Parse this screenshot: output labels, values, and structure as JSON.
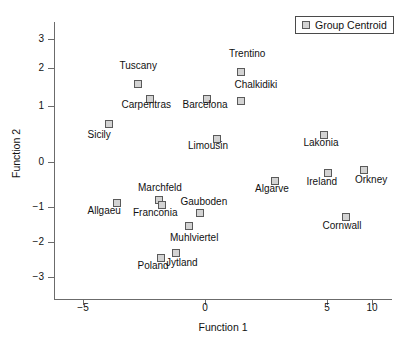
{
  "chart_data": {
    "type": "scatter",
    "title": "",
    "xlabel": "Function 1",
    "ylabel": "Function 2",
    "xlim": [
      -6.5,
      11.5
    ],
    "ylim": [
      -3.6,
      3.6
    ],
    "xticks": [
      -5,
      0,
      5,
      10
    ],
    "xtick_labels": [
      "−5",
      "0",
      "5",
      "10"
    ],
    "yticks": [
      3,
      2,
      1,
      0,
      -1,
      -2,
      -3
    ],
    "ytick_labels": [
      "3",
      "2",
      "1",
      "0",
      "−1",
      "−2",
      "−3"
    ],
    "grid": false,
    "legend_position": "top-right",
    "legend": [
      {
        "label": "Group Centroid",
        "marker": "square",
        "color": "#d3d3d3"
      }
    ],
    "series": [
      {
        "name": "Group Centroid",
        "points": [
          {
            "label": "Tuscany",
            "x": -2.7,
            "y": 1.55,
            "label_pos": "above"
          },
          {
            "label": "Carpentras",
            "x": -2.2,
            "y": 1.18,
            "label_pos": "below"
          },
          {
            "label": "Barcelona",
            "x": 0.1,
            "y": 1.18,
            "label_pos": "below"
          },
          {
            "label": "Trentino",
            "x": 1.5,
            "y": 1.82,
            "label_pos": "above"
          },
          {
            "label": "Chalkidiki",
            "x": 1.5,
            "y": 1.08,
            "label_pos": "above"
          },
          {
            "label": "Sicily",
            "x": -3.9,
            "y": 0.6,
            "label_pos": "below"
          },
          {
            "label": "Limousin",
            "x": 0.5,
            "y": 0.34,
            "label_pos": "below"
          },
          {
            "label": "Lakonia",
            "x": 4.9,
            "y": 0.43,
            "label_pos": "below"
          },
          {
            "label": "Orkney",
            "x": 8.9,
            "y": -0.25,
            "label_pos": "below"
          },
          {
            "label": "Ireland",
            "x": 5.1,
            "y": -0.33,
            "label_pos": "below"
          },
          {
            "label": "Algarve",
            "x": 2.9,
            "y": -0.44,
            "label_pos": "below"
          },
          {
            "label": "Allgaeu",
            "x": -3.6,
            "y": -0.82,
            "label_pos": "below"
          },
          {
            "label": "Marchfeld",
            "x": -1.9,
            "y": -0.76,
            "label_pos": "above"
          },
          {
            "label": "Franconia",
            "x": -1.8,
            "y": -0.84,
            "label_pos": "below"
          },
          {
            "label": "Gauboden",
            "x": -0.2,
            "y": -1.14,
            "label_pos": "above"
          },
          {
            "label": "Cornwall",
            "x": 6.7,
            "y": -1.19,
            "label_pos": "below"
          },
          {
            "label": "Muhlviertel",
            "x": -0.7,
            "y": -1.43,
            "label_pos": "below"
          },
          {
            "label": "Jytland",
            "x": -1.4,
            "y": -2.22,
            "label_pos": "below"
          },
          {
            "label": "Poland",
            "x": -1.8,
            "y": -2.38,
            "label_pos": "below"
          }
        ]
      }
    ]
  },
  "points_px": [
    {
      "name": "tuscany",
      "x": 138,
      "y": 84,
      "lx": 138,
      "ly": 66,
      "align": "center"
    },
    {
      "name": "carpentras",
      "x": 150,
      "y": 99,
      "lx": 146,
      "ly": 105,
      "align": "center"
    },
    {
      "name": "barcelona",
      "x": 207,
      "y": 99,
      "lx": 205,
      "ly": 105,
      "align": "center"
    },
    {
      "name": "trentino",
      "x": 241,
      "y": 72,
      "lx": 247,
      "ly": 54,
      "align": "center"
    },
    {
      "name": "chalkidiki",
      "x": 241,
      "y": 101,
      "lx": 256,
      "ly": 85,
      "align": "center"
    },
    {
      "name": "sicily",
      "x": 109,
      "y": 124,
      "lx": 99,
      "ly": 135,
      "align": "center"
    },
    {
      "name": "limousin",
      "x": 217,
      "y": 139,
      "lx": 208,
      "ly": 146,
      "align": "center"
    },
    {
      "name": "lakonia",
      "x": 324,
      "y": 135,
      "lx": 321,
      "ly": 143,
      "align": "center"
    },
    {
      "name": "orkney",
      "x": 364,
      "y": 170,
      "lx": 371,
      "ly": 180,
      "align": "center"
    },
    {
      "name": "ireland",
      "x": 328,
      "y": 173,
      "lx": 322,
      "ly": 182,
      "align": "center"
    },
    {
      "name": "algarve",
      "x": 275,
      "y": 181,
      "lx": 272,
      "ly": 189,
      "align": "center"
    },
    {
      "name": "allgaeu",
      "x": 117,
      "y": 203,
      "lx": 104,
      "ly": 211,
      "align": "center"
    },
    {
      "name": "marchfeld",
      "x": 159,
      "y": 200,
      "lx": 160,
      "ly": 188,
      "align": "center"
    },
    {
      "name": "franconia",
      "x": 162,
      "y": 205,
      "lx": 155,
      "ly": 213,
      "align": "center"
    },
    {
      "name": "gauboden",
      "x": 200,
      "y": 213,
      "lx": 204,
      "ly": 202,
      "align": "center"
    },
    {
      "name": "cornwall",
      "x": 346,
      "y": 217,
      "lx": 342,
      "ly": 226,
      "align": "center"
    },
    {
      "name": "muhlviertel",
      "x": 189,
      "y": 226,
      "lx": 194,
      "ly": 238,
      "align": "center"
    },
    {
      "name": "jytland",
      "x": 176,
      "y": 253,
      "lx": 182,
      "ly": 263,
      "align": "center"
    },
    {
      "name": "poland",
      "x": 161,
      "y": 258,
      "lx": 153,
      "ly": 266,
      "align": "center"
    }
  ],
  "axis_px": {
    "yticks": [
      {
        "v": "3",
        "py": 39
      },
      {
        "v": "2",
        "py": 68
      },
      {
        "v": "1",
        "py": 106
      },
      {
        "v": "0",
        "py": 162
      },
      {
        "v": "−1",
        "py": 207
      },
      {
        "v": "−2",
        "py": 242
      },
      {
        "v": "−3",
        "py": 277
      }
    ],
    "xticks": [
      {
        "v": "−5",
        "px": 83
      },
      {
        "v": "0",
        "px": 205
      },
      {
        "v": "5",
        "px": 327
      },
      {
        "v": "10",
        "px": 372
      }
    ]
  }
}
